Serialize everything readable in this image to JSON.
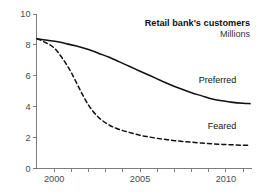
{
  "chart_data": {
    "type": "line",
    "title": "Retail bank's customers",
    "subtitle": "Millions",
    "xlabel": "",
    "ylabel": "",
    "units": "Millions",
    "grid": false,
    "legend_position": "inline-right",
    "xlim": [
      1999,
      2011.4
    ],
    "ylim": [
      0,
      10
    ],
    "y_ticks": [
      0,
      2,
      4,
      6,
      8,
      10
    ],
    "y_tick_labels": [
      "0",
      "2",
      "4",
      "6",
      "8",
      "10"
    ],
    "x_ticks": [
      2000,
      2001,
      2002,
      2003,
      2004,
      2005,
      2006,
      2007,
      2008,
      2009,
      2010,
      2011
    ],
    "x_tick_labels_shown": [
      "2000",
      "2005",
      "2010"
    ],
    "x_labeled_ticks": [
      2000,
      2005,
      2010
    ],
    "series": [
      {
        "name": "Preferred",
        "style": "solid",
        "color": "#111111",
        "x": [
          1999.0,
          1999.6,
          2000.2,
          2000.8,
          2001.4,
          2002.0,
          2002.6,
          2003.2,
          2003.8,
          2004.4,
          2005.0,
          2005.6,
          2006.2,
          2006.8,
          2007.4,
          2008.0,
          2008.6,
          2009.2,
          2009.8,
          2010.4,
          2011.0,
          2011.4
        ],
        "y": [
          8.4,
          8.3,
          8.2,
          8.05,
          7.9,
          7.7,
          7.45,
          7.2,
          6.9,
          6.6,
          6.3,
          6.0,
          5.7,
          5.4,
          5.15,
          4.9,
          4.7,
          4.5,
          4.38,
          4.28,
          4.22,
          4.2
        ]
      },
      {
        "name": "Feared",
        "style": "dashed",
        "color": "#111111",
        "x": [
          1999.0,
          1999.5,
          2000.0,
          2000.5,
          2001.0,
          2001.5,
          2002.0,
          2002.5,
          2003.0,
          2003.5,
          2004.0,
          2004.5,
          2005.0,
          2005.5,
          2006.0,
          2006.5,
          2007.0,
          2007.5,
          2008.0,
          2008.6,
          2009.2,
          2009.8,
          2010.4,
          2011.0,
          2011.4
        ],
        "y": [
          8.4,
          8.15,
          7.8,
          7.1,
          6.2,
          5.1,
          4.1,
          3.4,
          2.95,
          2.65,
          2.45,
          2.3,
          2.15,
          2.05,
          1.95,
          1.88,
          1.8,
          1.75,
          1.7,
          1.65,
          1.6,
          1.56,
          1.53,
          1.5,
          1.5
        ]
      }
    ],
    "annotations": [
      {
        "text": "Preferred",
        "x": 2010.6,
        "y": 5.55
      },
      {
        "text": "Feared",
        "x": 2010.6,
        "y": 2.55
      }
    ]
  }
}
